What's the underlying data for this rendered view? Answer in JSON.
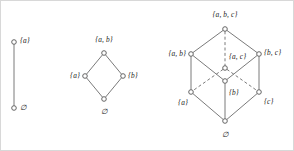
{
  "figure": {
    "background_color": "#ffffff",
    "line_color": "#6b6b6b",
    "node_fill": "#ffffff",
    "node_stroke": "#555555"
  },
  "diagrams": [
    {
      "name": "power-set-one-element",
      "nodes": [
        {
          "id": "a",
          "label": "{a}",
          "x": 13,
          "y": 41,
          "label_x": 19,
          "label_y": 40,
          "align": "right"
        },
        {
          "id": "empty",
          "label": "∅",
          "x": 13,
          "y": 107,
          "label_x": 19,
          "label_y": 107,
          "align": "right"
        }
      ],
      "edges": [
        {
          "from": "empty",
          "to": "a",
          "style": "solid"
        }
      ]
    },
    {
      "name": "power-set-two-elements",
      "nodes": [
        {
          "id": "ab",
          "label": "{a, b}",
          "x": 103,
          "y": 52,
          "label_x": 103,
          "label_y": 39,
          "align": "center"
        },
        {
          "id": "a",
          "label": "{a}",
          "x": 84,
          "y": 75,
          "label_x": 79,
          "label_y": 75,
          "align": "left"
        },
        {
          "id": "b",
          "label": "{b}",
          "x": 122,
          "y": 75,
          "label_x": 127,
          "label_y": 75,
          "align": "right"
        },
        {
          "id": "empty",
          "label": "∅",
          "x": 103,
          "y": 98,
          "label_x": 103,
          "label_y": 111,
          "align": "center"
        }
      ],
      "edges": [
        {
          "from": "empty",
          "to": "a",
          "style": "solid"
        },
        {
          "from": "empty",
          "to": "b",
          "style": "solid"
        },
        {
          "from": "a",
          "to": "ab",
          "style": "solid"
        },
        {
          "from": "b",
          "to": "ab",
          "style": "solid"
        }
      ]
    },
    {
      "name": "power-set-three-elements",
      "nodes": [
        {
          "id": "abc",
          "label": "{a, b, c}",
          "x": 224,
          "y": 28,
          "label_x": 224,
          "label_y": 14,
          "align": "center"
        },
        {
          "id": "ab",
          "label": "{a, b}",
          "x": 190,
          "y": 53,
          "label_x": 185,
          "label_y": 53,
          "align": "left"
        },
        {
          "id": "bc",
          "label": "{b, c}",
          "x": 258,
          "y": 53,
          "label_x": 263,
          "label_y": 52,
          "align": "right"
        },
        {
          "id": "ac",
          "label": "{a, c}",
          "x": 224,
          "y": 67,
          "label_x": 228,
          "label_y": 56,
          "align": "right"
        },
        {
          "id": "a",
          "label": "{a}",
          "x": 190,
          "y": 91,
          "label_x": 187,
          "label_y": 102,
          "align": "left"
        },
        {
          "id": "b",
          "label": "{b}",
          "x": 224,
          "y": 80,
          "label_x": 228,
          "label_y": 92,
          "align": "right"
        },
        {
          "id": "c",
          "label": "{c}",
          "x": 258,
          "y": 91,
          "label_x": 263,
          "label_y": 101,
          "align": "right"
        },
        {
          "id": "empty",
          "label": "∅",
          "x": 224,
          "y": 120,
          "label_x": 224,
          "label_y": 134,
          "align": "center"
        }
      ],
      "edges": [
        {
          "from": "abc",
          "to": "ab",
          "style": "solid"
        },
        {
          "from": "abc",
          "to": "bc",
          "style": "solid"
        },
        {
          "from": "abc",
          "to": "ac",
          "style": "dashed"
        },
        {
          "from": "ab",
          "to": "a",
          "style": "solid"
        },
        {
          "from": "ab",
          "to": "b",
          "style": "solid"
        },
        {
          "from": "bc",
          "to": "b",
          "style": "solid"
        },
        {
          "from": "bc",
          "to": "c",
          "style": "solid"
        },
        {
          "from": "ac",
          "to": "a",
          "style": "dashed"
        },
        {
          "from": "ac",
          "to": "c",
          "style": "dashed"
        },
        {
          "from": "a",
          "to": "empty",
          "style": "solid"
        },
        {
          "from": "b",
          "to": "empty",
          "style": "solid"
        },
        {
          "from": "c",
          "to": "empty",
          "style": "solid"
        }
      ]
    }
  ]
}
